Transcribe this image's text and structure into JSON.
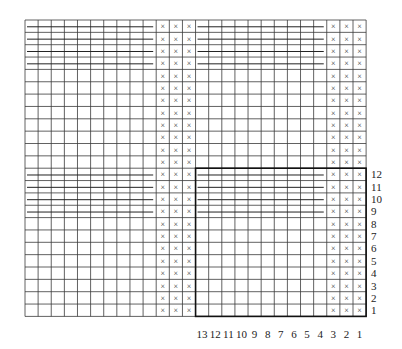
{
  "diagram": {
    "type": "knitting-chart",
    "grid": {
      "columns": 26,
      "rows": 24
    },
    "stitch_symbol": "×",
    "stitch_columns_from_left": [
      11,
      12,
      13,
      24,
      25,
      26
    ],
    "strand_rows_from_top": [
      1,
      2,
      3,
      4
    ],
    "strand_rows_lower_numbered": [
      9,
      10,
      11,
      12
    ],
    "highlight_box": {
      "columns_label_range": [
        1,
        13
      ],
      "rows_label_range": [
        1,
        12
      ]
    },
    "column_labels": [
      "13",
      "12",
      "11",
      "10",
      "9",
      "8",
      "7",
      "6",
      "5",
      "4",
      "3",
      "2",
      "1"
    ],
    "row_labels": [
      "1",
      "2",
      "3",
      "4",
      "5",
      "6",
      "7",
      "8",
      "9",
      "10",
      "11",
      "12"
    ],
    "colors": {
      "grid": "#3a3a3a",
      "stitch": "#333333",
      "background": "#ffffff"
    }
  }
}
